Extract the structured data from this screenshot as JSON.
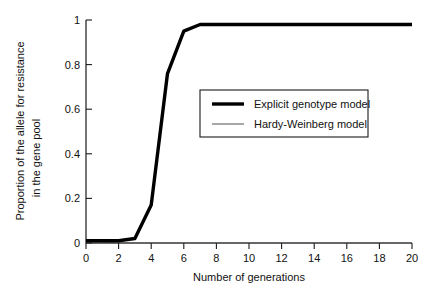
{
  "chart_data": {
    "type": "line",
    "title": "",
    "xlabel": "Number of generations",
    "ylabel": "Proportion of the allele for resistance in the gene pool",
    "ylabel_line1": "Proportion of the allele for resistance",
    "ylabel_line2": "in the gene pool",
    "xlim": [
      0,
      20
    ],
    "ylim": [
      0,
      1
    ],
    "grid": false,
    "legend_position": "center-right",
    "xticks": [
      0,
      2,
      4,
      6,
      8,
      10,
      12,
      14,
      16,
      18,
      20
    ],
    "xtick_labels": [
      "0",
      "2",
      "4",
      "6",
      "8",
      "10",
      "12",
      "14",
      "16",
      "18",
      "20"
    ],
    "yticks": [
      0,
      0.2,
      0.4,
      0.6,
      0.8,
      1
    ],
    "ytick_labels": [
      "0",
      "0.2",
      "0.4",
      "0.6",
      "0.8",
      "1"
    ],
    "x": [
      0,
      1,
      2,
      3,
      4,
      5,
      6,
      7,
      8,
      10,
      12,
      14,
      16,
      18,
      20
    ],
    "series": [
      {
        "name": "Explicit genotype model",
        "style": "thick",
        "color": "#000000",
        "values": [
          0.01,
          0.01,
          0.01,
          0.02,
          0.17,
          0.76,
          0.95,
          0.98,
          0.98,
          0.98,
          0.98,
          0.98,
          0.98,
          0.98,
          0.98
        ]
      },
      {
        "name": "Hardy-Weinberg model",
        "style": "thin",
        "color": "#3a3a3a",
        "values": [
          0,
          0,
          0,
          0,
          0,
          0,
          0,
          0,
          0,
          0,
          0,
          0,
          0,
          0,
          0
        ]
      }
    ]
  },
  "legend": {
    "entries": [
      {
        "label": "Explicit genotype model"
      },
      {
        "label": "Hardy-Weinberg model"
      }
    ]
  }
}
